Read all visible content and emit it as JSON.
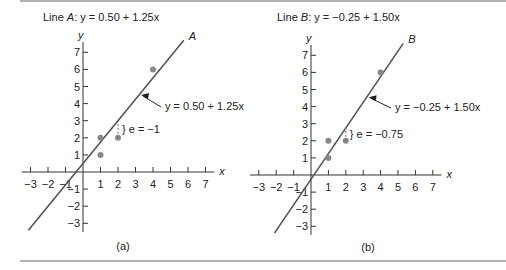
{
  "figure": {
    "panels": [
      {
        "id": "a",
        "title_prefix": "Line ",
        "title_var": "A",
        "title_eq": ":   y = 0.50 + 1.25x",
        "line_label": "A",
        "annotation": "y = 0.50 + 1.25x",
        "residual_label": "} e = −1",
        "caption": "(a)"
      },
      {
        "id": "b",
        "title_prefix": "Line ",
        "title_var": "B",
        "title_eq": ":   y = −0.25 + 1.50x",
        "line_label": "B",
        "annotation": "y = −0.25 + 1.50x",
        "residual_label": "} e = −0.75",
        "caption": "(b)"
      }
    ],
    "axis_label_x": "x",
    "axis_label_y": "y"
  },
  "chart_data": [
    {
      "type": "scatter",
      "title": "Line A: y = 0.50 + 1.25x",
      "xlabel": "x",
      "ylabel": "y",
      "xlim": [
        -3,
        7
      ],
      "ylim": [
        -3,
        7
      ],
      "x_ticks": [
        -3,
        -2,
        -1,
        1,
        2,
        3,
        4,
        5,
        6,
        7
      ],
      "y_ticks": [
        -3,
        -2,
        -1,
        1,
        2,
        3,
        4,
        5,
        6,
        7
      ],
      "points": [
        {
          "x": 1,
          "y": 1
        },
        {
          "x": 1,
          "y": 2
        },
        {
          "x": 2,
          "y": 2
        },
        {
          "x": 4,
          "y": 6
        }
      ],
      "fit_line": {
        "intercept": 0.5,
        "slope": 1.25
      },
      "residual_annotation": {
        "x": 2,
        "e": -1
      },
      "caption": "(a)"
    },
    {
      "type": "scatter",
      "title": "Line B: y = -0.25 + 1.50x",
      "xlabel": "x",
      "ylabel": "y",
      "xlim": [
        -3,
        7
      ],
      "ylim": [
        -3,
        7
      ],
      "x_ticks": [
        -3,
        -2,
        -1,
        1,
        2,
        3,
        4,
        5,
        6,
        7
      ],
      "y_ticks": [
        -3,
        -2,
        -1,
        1,
        2,
        3,
        4,
        5,
        6,
        7
      ],
      "points": [
        {
          "x": 1,
          "y": 1
        },
        {
          "x": 1,
          "y": 2
        },
        {
          "x": 2,
          "y": 2
        },
        {
          "x": 4,
          "y": 6
        }
      ],
      "fit_line": {
        "intercept": -0.25,
        "slope": 1.5
      },
      "residual_annotation": {
        "x": 2,
        "e": -0.75
      },
      "caption": "(b)"
    }
  ]
}
